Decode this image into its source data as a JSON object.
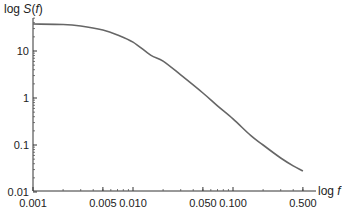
{
  "chart_data": {
    "type": "line",
    "title": "",
    "xlabel": "log f",
    "ylabel": "log S(f)",
    "xlabel_parts": {
      "prefix": "log ",
      "var": "f"
    },
    "ylabel_parts": {
      "prefix": "log ",
      "var": "S",
      "open": "(",
      "arg": "f",
      "close": ")"
    },
    "xscale": "log",
    "yscale": "log",
    "xlim": [
      0.001,
      0.6
    ],
    "ylim": [
      0.01,
      50
    ],
    "grid": false,
    "legend": null,
    "x_ticks": [
      {
        "value": 0.001,
        "label": "0.001"
      },
      {
        "value": 0.005,
        "label": "0.005"
      },
      {
        "value": 0.01,
        "label": "0.010"
      },
      {
        "value": 0.05,
        "label": "0.050"
      },
      {
        "value": 0.1,
        "label": "0.100"
      },
      {
        "value": 0.5,
        "label": "0.500"
      }
    ],
    "y_ticks": [
      {
        "value": 0.01,
        "label": "0.01"
      },
      {
        "value": 0.1,
        "label": "0.1"
      },
      {
        "value": 1,
        "label": "1"
      },
      {
        "value": 10,
        "label": "10"
      }
    ],
    "series": [
      {
        "name": "S(f)",
        "color": "#666666",
        "x": [
          0.001,
          0.002,
          0.003,
          0.005,
          0.007,
          0.01,
          0.015,
          0.02,
          0.03,
          0.05,
          0.07,
          0.1,
          0.15,
          0.2,
          0.3,
          0.4,
          0.5
        ],
        "y": [
          37.5,
          36.6,
          34.0,
          28.0,
          22.0,
          15.5,
          8.2,
          6.1,
          3.1,
          1.28,
          0.68,
          0.36,
          0.16,
          0.1,
          0.053,
          0.036,
          0.028
        ]
      }
    ]
  }
}
